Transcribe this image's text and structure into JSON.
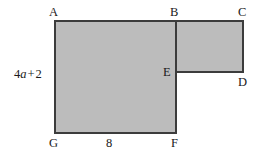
{
  "figure": {
    "type": "composite-rectilinear-polygon",
    "fill_color": "#bcbcbc",
    "stroke_color": "#3c3c3c",
    "background_color": "#ffffff",
    "stroke_width": 2,
    "outline_points": "55,21 243,21 243,72 176,72 176,133 55,133",
    "internal_segment": "176,21 176,72"
  },
  "vertices": [
    {
      "id": "A",
      "label": "A",
      "x": 55,
      "y": 21,
      "label_x": 49,
      "label_y": 6
    },
    {
      "id": "B",
      "label": "B",
      "x": 176,
      "y": 21,
      "label_x": 170,
      "label_y": 6
    },
    {
      "id": "C",
      "label": "C",
      "x": 243,
      "y": 21,
      "label_x": 238,
      "label_y": 6
    },
    {
      "id": "D",
      "label": "D",
      "x": 243,
      "y": 72,
      "label_x": 238,
      "label_y": 76
    },
    {
      "id": "E",
      "label": "E",
      "x": 176,
      "y": 72,
      "label_x": 163,
      "label_y": 66
    },
    {
      "id": "F",
      "label": "F",
      "x": 176,
      "y": 133,
      "label_x": 171,
      "label_y": 137
    },
    {
      "id": "G",
      "label": "G",
      "x": 55,
      "y": 133,
      "label_x": 49,
      "label_y": 137
    }
  ],
  "measurements": [
    {
      "id": "left-side",
      "edge": "AG",
      "parts": {
        "coefficient": "4",
        "variable": "a",
        "operator": "+",
        "constant": "2"
      },
      "plain_text": "4a + 2",
      "label_x": 14,
      "label_y": 68
    },
    {
      "id": "bottom-side",
      "edge": "GF",
      "plain_text": "8",
      "label_x": 106,
      "label_y": 137
    }
  ]
}
